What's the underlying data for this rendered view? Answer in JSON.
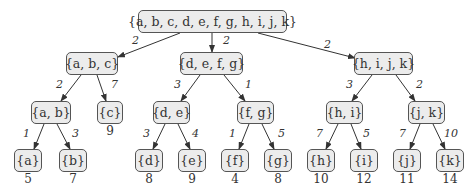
{
  "nodes": {
    "root": "{a, b, c, d, e, f, g, h, i, j, k}",
    "abc": "{a, b, c}",
    "defg": "{d, e, f, g}",
    "hijk": "{h, i, j, k}",
    "ab": "{a, b}",
    "c": "{c}",
    "de": "{d, e}",
    "fg": "{f, g}",
    "hi": "{h, i}",
    "jk": "{j, k}",
    "a": "{a}",
    "b": "{b}",
    "d": "{d}",
    "e": "{e}",
    "f": "{f}",
    "g": "{g}",
    "h": "{h}",
    "i": "{i}",
    "j": "{j}",
    "k": "{k}"
  },
  "edge_weights": {
    "root_abc": "2",
    "root_defg": "2",
    "root_hijk": "2",
    "abc_ab": "2",
    "abc_c": "7",
    "defg_de": "3",
    "defg_fg": "1",
    "hijk_hi": "3",
    "hijk_jk": "2",
    "ab_a": "1",
    "ab_b": "3",
    "de_d": "3",
    "de_e": "4",
    "fg_f": "1",
    "fg_g": "5",
    "hi_h": "7",
    "hi_i": "5",
    "jk_j": "7",
    "jk_k": "10"
  },
  "leaf_costs": {
    "a": "5",
    "b": "7",
    "c": "9",
    "d": "8",
    "e": "9",
    "f": "4",
    "g": "8",
    "h": "10",
    "i": "12",
    "j": "11",
    "k": "14"
  }
}
